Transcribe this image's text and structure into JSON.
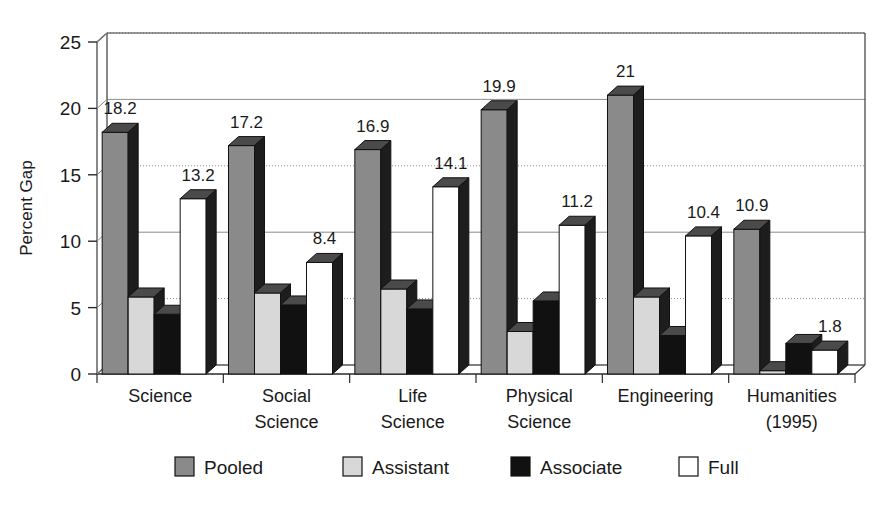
{
  "chart_data": {
    "type": "bar",
    "title": "",
    "subtitle": "",
    "xlabel": "",
    "ylabel": "Percent Gap",
    "ylim": [
      0,
      25
    ],
    "yticks": [
      0,
      5,
      10,
      15,
      20,
      25
    ],
    "ytick_labels": [
      "0",
      "5",
      "10",
      "15",
      "20",
      "25"
    ],
    "grid": true,
    "grid_axis": "y",
    "legend_position": "bottom",
    "style": "3d-grayscale-bars",
    "categories": [
      "Science",
      "Social Science",
      "Life Science",
      "Physical Science",
      "Engineering",
      "Humanities (1995)"
    ],
    "category_lines": [
      [
        "Science"
      ],
      [
        "Social",
        "Science"
      ],
      [
        "Life",
        "Science"
      ],
      [
        "Physical",
        "Science"
      ],
      [
        "Engineering"
      ],
      [
        "Humanities",
        "(1995)"
      ]
    ],
    "series": [
      {
        "name": "Pooled",
        "color": "#8a8a8a",
        "values": [
          18.2,
          17.2,
          16.9,
          19.9,
          21.0,
          10.9
        ],
        "labels": [
          "18.2",
          "17.2",
          "16.9",
          "19.9",
          "21",
          "10.9"
        ],
        "labeled": true
      },
      {
        "name": "Assistant",
        "color": "#d8d8d8",
        "values": [
          5.8,
          6.1,
          6.4,
          3.2,
          5.8,
          0.25
        ],
        "labels": [
          "",
          "",
          "",
          "",
          "",
          ""
        ],
        "labeled": false
      },
      {
        "name": "Associate",
        "color": "#111111",
        "values": [
          4.5,
          5.2,
          4.9,
          5.5,
          2.9,
          2.3
        ],
        "labels": [
          "",
          "",
          "",
          "",
          "",
          ""
        ],
        "labeled": false
      },
      {
        "name": "Full",
        "color": "#ffffff",
        "values": [
          13.2,
          8.4,
          14.1,
          11.2,
          10.4,
          1.8
        ],
        "labels": [
          "13.2",
          "8.4",
          "14.1",
          "11.2",
          "10.4",
          "1.8"
        ],
        "labeled": true
      }
    ],
    "legend": [
      {
        "label": "Pooled",
        "color": "#8a8a8a"
      },
      {
        "label": "Assistant",
        "color": "#d8d8d8"
      },
      {
        "label": "Associate",
        "color": "#111111"
      },
      {
        "label": "Full",
        "color": "#ffffff"
      }
    ]
  },
  "axes": {
    "y_title": "Percent Gap",
    "y_tick_0": "0",
    "y_tick_5": "5",
    "y_tick_10": "10",
    "y_tick_15": "15",
    "y_tick_20": "20",
    "y_tick_25": "25"
  }
}
